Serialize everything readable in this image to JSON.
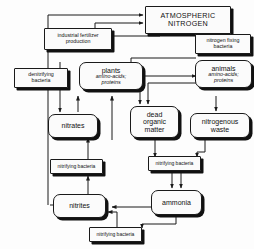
{
  "diagram": {
    "background_color": "#fdfdfd",
    "line_color": "#1a1a1a",
    "box_fill": "#fbfbfb",
    "shadow_color": "#111111"
  },
  "nodes": {
    "atmospheric_nitrogen": {
      "line1": "ATMOSPHERIC",
      "line2": "NITROGEN"
    },
    "industrial_fertilizer": {
      "line1": "industrial fertilizer",
      "line2": "production"
    },
    "nitrogen_fixing_bacteria": {
      "line1": "nitrogen fixing",
      "line2": "bacteria"
    },
    "denitrifying_bacteria": {
      "line1": "denitrifying",
      "line2": "bacteria"
    },
    "plants": {
      "line1": "plants",
      "line2": "amino-acids;",
      "line3": "proteins"
    },
    "animals": {
      "line1": "animals",
      "line2": "amino-acids;",
      "line3": "proteins"
    },
    "dead_organic_matter": {
      "line1": "dead",
      "line2": "organic",
      "line3": "matter"
    },
    "nitrogenous_waste": {
      "line1": "nitrogenous",
      "line2": "waste"
    },
    "nitrates": {
      "line1": "nitrates"
    },
    "nitrites": {
      "line1": "nitrites"
    },
    "ammonia": {
      "line1": "ammonia"
    },
    "nitrifying_bacteria_upper": {
      "line1": "nitrifying bacteria"
    },
    "nitrifying_bacteria_middle": {
      "line1": "nitrifying bacteria"
    },
    "nitrifying_bacteria_lower": {
      "line1": "nitrifying bacteria"
    }
  },
  "edges": [
    {
      "from": "denitrifying_bacteria",
      "to": "atmospheric_nitrogen"
    },
    {
      "from": "nitrites",
      "to": "denitrifying_bacteria"
    },
    {
      "from": "industrial_fertilizer",
      "to": "atmospheric_nitrogen"
    },
    {
      "from": "atmospheric_nitrogen",
      "to": "industrial_fertilizer"
    },
    {
      "from": "atmospheric_nitrogen",
      "to": "nitrogen_fixing_bacteria"
    },
    {
      "from": "nitrogen_fixing_bacteria",
      "to": "plants"
    },
    {
      "from": "industrial_fertilizer",
      "to": "nitrates"
    },
    {
      "from": "nitrates",
      "to": "plants"
    },
    {
      "from": "plants",
      "to": "animals"
    },
    {
      "from": "plants",
      "to": "dead_organic_matter"
    },
    {
      "from": "animals",
      "to": "dead_organic_matter"
    },
    {
      "from": "animals",
      "to": "nitrogenous_waste"
    },
    {
      "from": "dead_organic_matter",
      "to": "nitrifying_bacteria_middle"
    },
    {
      "from": "nitrogenous_waste",
      "to": "nitrifying_bacteria_middle"
    },
    {
      "from": "nitrifying_bacteria_middle",
      "to": "ammonia"
    },
    {
      "from": "ammonia",
      "to": "nitrifying_bacteria_lower"
    },
    {
      "from": "nitrifying_bacteria_lower",
      "to": "nitrites"
    },
    {
      "from": "nitrites",
      "to": "nitrifying_bacteria_upper"
    },
    {
      "from": "nitrifying_bacteria_upper",
      "to": "nitrates"
    }
  ]
}
